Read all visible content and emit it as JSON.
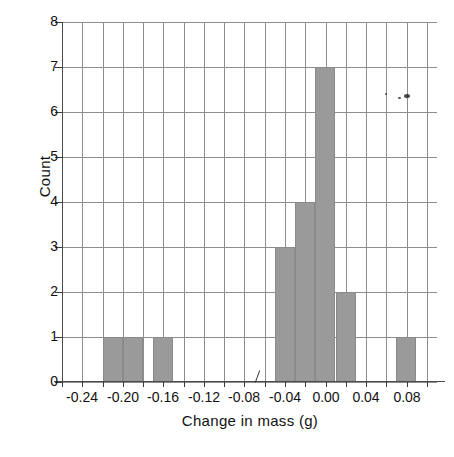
{
  "chart_data": {
    "type": "bar",
    "title": "",
    "xlabel": "Change in mass (g)",
    "ylabel": "Count",
    "xlim": [
      -0.26,
      0.11
    ],
    "ylim": [
      0,
      8
    ],
    "bin_width": 0.02,
    "grid": true,
    "legend": null,
    "x_ticks": [
      "-0.24",
      "-0.20",
      "-0.16",
      "-0.12",
      "-0.08",
      "-0.04",
      "0.00",
      "0.04",
      "0.08"
    ],
    "x_tick_values": [
      -0.24,
      -0.2,
      -0.16,
      -0.12,
      -0.08,
      -0.04,
      0.0,
      0.04,
      0.08
    ],
    "y_ticks": [
      "0",
      "1",
      "2",
      "3",
      "4",
      "5",
      "6",
      "7",
      "8"
    ],
    "y_tick_values": [
      0,
      1,
      2,
      3,
      4,
      5,
      6,
      7,
      8
    ],
    "bins": [
      {
        "left": -0.22,
        "right": -0.2,
        "count": 1
      },
      {
        "left": -0.2,
        "right": -0.18,
        "count": 1
      },
      {
        "left": -0.17,
        "right": -0.15,
        "count": 1
      },
      {
        "left": -0.05,
        "right": -0.03,
        "count": 3
      },
      {
        "left": -0.03,
        "right": -0.01,
        "count": 4
      },
      {
        "left": -0.01,
        "right": 0.01,
        "count": 7
      },
      {
        "left": 0.01,
        "right": 0.03,
        "count": 2
      },
      {
        "left": 0.07,
        "right": 0.09,
        "count": 1
      }
    ],
    "categories": [
      "-0.22 to -0.20",
      "-0.20 to -0.18",
      "-0.17 to -0.15",
      "-0.05 to -0.03",
      "-0.03 to -0.01",
      "-0.01 to 0.01",
      "0.01 to 0.03",
      "0.07 to 0.09"
    ],
    "values": [
      1,
      1,
      1,
      3,
      4,
      7,
      2,
      1
    ],
    "total_count": 20,
    "bar_color": "#9a9a9a",
    "grid_color": "#8e8e8e",
    "axis_color": "#3a3a3a"
  }
}
